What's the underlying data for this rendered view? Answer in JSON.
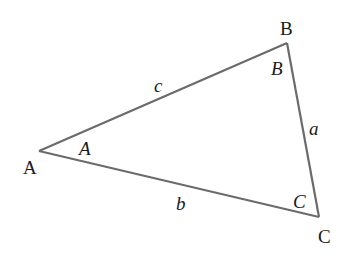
{
  "diagram": {
    "type": "triangle",
    "stroke_color": "#6b6b6b",
    "vertices": {
      "A": {
        "label": "A",
        "x": 39,
        "y": 151
      },
      "B": {
        "label": "B",
        "x": 287,
        "y": 43
      },
      "C": {
        "label": "C",
        "x": 319,
        "y": 217
      }
    },
    "vertex_labels": {
      "A": "A",
      "B": "B",
      "C": "C"
    },
    "angle_labels": {
      "A": "A",
      "B": "B",
      "C": "C"
    },
    "side_labels": {
      "a": "a",
      "b": "b",
      "c": "c"
    }
  }
}
